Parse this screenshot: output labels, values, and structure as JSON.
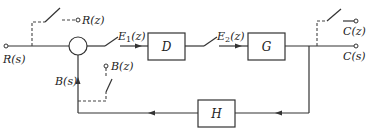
{
  "diagram": {
    "type": "sampled-data feedback control block diagram",
    "blocks": {
      "D": "D",
      "G": "G",
      "H": "H"
    },
    "signals": {
      "input_continuous": "R(s)",
      "input_sampled": "R(z)",
      "error_sampled": "E₁(z)",
      "controller_output_sampled": "E₂(z)",
      "output_continuous": "C(s)",
      "output_sampled": "C(z)",
      "feedback_continuous": "B(s)",
      "feedback_sampled": "B(z)"
    },
    "connections": [
      {
        "from": "R(s)",
        "to": "summing-junction"
      },
      {
        "from": "summing-junction",
        "to": "D",
        "via": "sampler",
        "label": "E₁(z)"
      },
      {
        "from": "D",
        "to": "G",
        "via": "sampler",
        "label": "E₂(z)"
      },
      {
        "from": "G",
        "to": "C(s)"
      },
      {
        "from": "G-output",
        "to": "C(z)",
        "via": "sampler (dashed)"
      },
      {
        "from": "G-output",
        "to": "H"
      },
      {
        "from": "H",
        "to": "summing-junction",
        "label": "B(s)"
      },
      {
        "from": "R(s)",
        "to": "R(z)",
        "via": "sampler (dashed)"
      },
      {
        "from": "B(s)",
        "to": "B(z)",
        "via": "sampler (dashed)"
      }
    ]
  }
}
